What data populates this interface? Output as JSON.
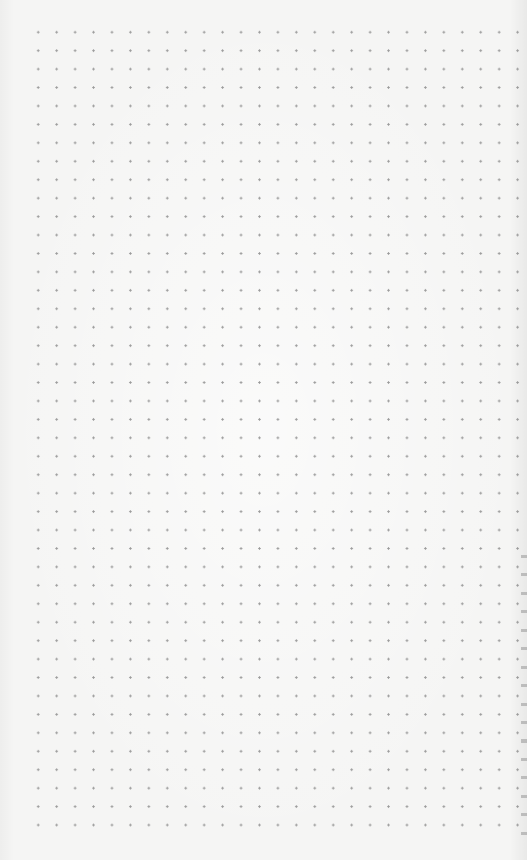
{
  "page": {
    "type": "dotted-paper-canvas",
    "background_color": "#f5f5f4",
    "dot_color": "#9a9a9a",
    "dot_spacing_px": 18.45,
    "grid": {
      "columns": 27,
      "rows": 44
    },
    "content": ""
  }
}
